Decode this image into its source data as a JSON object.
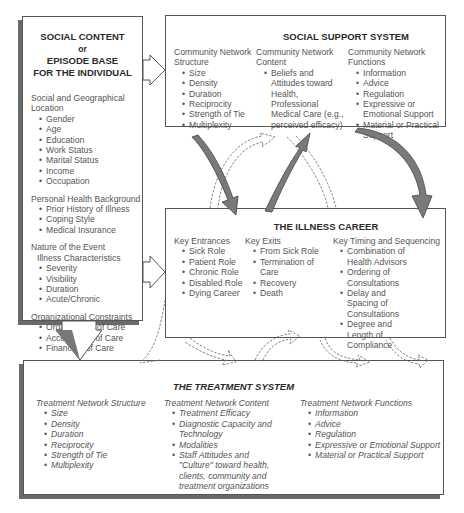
{
  "social_content": {
    "title_lines": [
      "SOCIAL CONTENT",
      "or",
      "EPISODE BASE",
      "FOR THE INDIVIDUAL"
    ],
    "sections": [
      {
        "heading": "Social and Geographical Location",
        "items": [
          "Gender",
          "Age",
          "Education",
          "Work Status",
          "Marital Status",
          "Income",
          "Occupation"
        ]
      },
      {
        "heading": "Personal Health Background",
        "items": [
          "Prior History of Illness",
          "Coping Style",
          "Medical Insurance"
        ]
      },
      {
        "heading": "Nature of the Event",
        "subheading": "Illness Characteristics",
        "items": [
          "Severity",
          "Visibility",
          "Duration",
          "Acute/Chronic"
        ]
      },
      {
        "heading": "Organizational Constraints",
        "items": [
          "Organization of Care",
          "Accessibility of Care",
          "Financing of Care"
        ]
      }
    ]
  },
  "social_support": {
    "title": "SOCIAL SUPPORT SYSTEM",
    "columns": [
      {
        "heading": "Community Network Structure",
        "items": [
          "Size",
          "Density",
          "Duration",
          "Reciprocity",
          "Strength of Tie",
          "Multiplexity"
        ]
      },
      {
        "heading": "Community Network Content",
        "items": [
          "Beliefs and Attitudes toward Health, Professional Medical Care (e.g., perceived efficacy)"
        ]
      },
      {
        "heading": "Community Network Functions",
        "items": [
          "Information",
          "Advice",
          "Regulation",
          "Expressive or Emotional Support",
          "Material or Practical Support"
        ]
      }
    ]
  },
  "illness_career": {
    "title": "THE ILLNESS CAREER",
    "columns": [
      {
        "heading": "Key Entrances",
        "items": [
          "Sick Role",
          "Patient Role",
          "Chronic Role",
          "Disabled Role",
          "Dying Career"
        ]
      },
      {
        "heading": "Key Exits",
        "items": [
          "From Sick Role",
          "Termination of Care",
          "Recovery",
          "Death"
        ]
      },
      {
        "heading": "Key Timing and Sequencing",
        "items": [
          "Combination of Health Advisors",
          "Ordering of Consultations",
          "Delay and Spacing of Consultations",
          "Degree and Length of Compliance"
        ]
      }
    ]
  },
  "treatment_system": {
    "title": "THE TREATMENT SYSTEM",
    "columns": [
      {
        "heading": "Treatment Network Structure",
        "items": [
          "Size",
          "Density",
          "Duration",
          "Reciprocity",
          "Strength of Tie",
          "Multiplexity"
        ]
      },
      {
        "heading": "Treatment Network Content",
        "items": [
          "Treatment Efficacy",
          "Diagnostic Capacity and Technology",
          "Modalities",
          "Staff Attitudes and \"Culture\" toward health, clients, community and treatment organizations"
        ]
      },
      {
        "heading": "Treatment Network Functions",
        "items": [
          "Information",
          "Advice",
          "Regulation",
          "Expressive or Emotional Support",
          "Material or Practical Support"
        ]
      }
    ]
  },
  "colors": {
    "solid_arrow": "#7a7a7a",
    "box_border": "#555555",
    "box_shadow": "#6a6a6a",
    "text": "#555555",
    "title": "#2a2a2a"
  }
}
